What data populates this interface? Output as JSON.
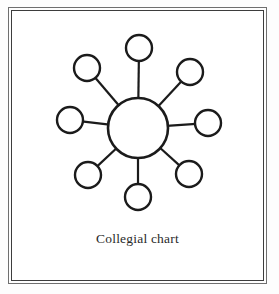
{
  "figure": {
    "caption": "Collegial chart",
    "ink_color": "#1b1b1b",
    "paper_color": "#ffffff",
    "frame": {
      "outer_color": "#6f6f6f",
      "inner_color": "#3d3d3d",
      "style": "double-rule"
    }
  },
  "chart_data": {
    "type": "diagram",
    "diagram_kind": "hub-and-spoke",
    "title": "Collegial chart",
    "hub": {
      "id": "hub",
      "label": "",
      "cx": 127,
      "cy": 118,
      "r": 30,
      "stroke_width": 2.6
    },
    "satellite_radius": 13,
    "satellite_stroke_width": 2.4,
    "spoke_stroke_width": 2.2,
    "node_count": 8,
    "nodes": [
      {
        "id": "n-top",
        "label": "",
        "angle_deg": 270,
        "cx": 128,
        "cy": 38
      },
      {
        "id": "n-top-right",
        "label": "",
        "angle_deg": 315,
        "cx": 179,
        "cy": 62
      },
      {
        "id": "n-right",
        "label": "",
        "angle_deg": 0,
        "cx": 197,
        "cy": 113
      },
      {
        "id": "n-bottom-right",
        "label": "",
        "angle_deg": 45,
        "cx": 178,
        "cy": 164
      },
      {
        "id": "n-bottom",
        "label": "",
        "angle_deg": 90,
        "cx": 127,
        "cy": 187
      },
      {
        "id": "n-bottom-left",
        "label": "",
        "angle_deg": 135,
        "cx": 77,
        "cy": 165
      },
      {
        "id": "n-left",
        "label": "",
        "angle_deg": 180,
        "cx": 59,
        "cy": 110
      },
      {
        "id": "n-top-left",
        "label": "",
        "angle_deg": 225,
        "cx": 76,
        "cy": 58
      }
    ],
    "edges": [
      {
        "from": "hub",
        "to": "n-top"
      },
      {
        "from": "hub",
        "to": "n-top-right"
      },
      {
        "from": "hub",
        "to": "n-right"
      },
      {
        "from": "hub",
        "to": "n-bottom-right"
      },
      {
        "from": "hub",
        "to": "n-bottom"
      },
      {
        "from": "hub",
        "to": "n-bottom-left"
      },
      {
        "from": "hub",
        "to": "n-left"
      },
      {
        "from": "hub",
        "to": "n-top-left"
      }
    ],
    "legend": [],
    "grid": false
  }
}
